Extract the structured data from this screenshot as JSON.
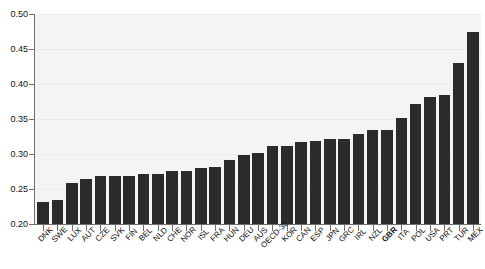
{
  "chart_data": {
    "type": "bar",
    "title": "",
    "subtitle": "",
    "xlabel": "",
    "ylabel": "",
    "ylim": [
      0.2,
      0.5
    ],
    "yticks": [
      0.2,
      0.25,
      0.3,
      0.35,
      0.4,
      0.45,
      0.5
    ],
    "ytick_labels": [
      "0.20",
      "0.25",
      "0.30",
      "0.35",
      "0.40",
      "0.45",
      "0.50"
    ],
    "grid": true,
    "legend": null,
    "bar_color": "#2b2b2b",
    "plot_background": "#f4f4f4",
    "highlight_category": "GBR",
    "categories": [
      "DNK",
      "SWE",
      "LUX",
      "AUT",
      "CZE",
      "SVK",
      "FIN",
      "BEL",
      "NLD",
      "CHE",
      "NOR",
      "ISL",
      "FRA",
      "HUN",
      "DEU",
      "AUS",
      "OECD-30",
      "KOR",
      "CAN",
      "ESP",
      "JPN",
      "GRC",
      "IRL",
      "NZL",
      "GBR",
      "ITA",
      "POL",
      "USA",
      "PRT",
      "TUR",
      "MEX"
    ],
    "values": [
      0.232,
      0.234,
      0.258,
      0.265,
      0.268,
      0.268,
      0.269,
      0.271,
      0.271,
      0.276,
      0.276,
      0.28,
      0.281,
      0.291,
      0.298,
      0.301,
      0.311,
      0.312,
      0.317,
      0.319,
      0.321,
      0.321,
      0.328,
      0.335,
      0.335,
      0.352,
      0.372,
      0.381,
      0.385,
      0.43,
      0.474
    ]
  }
}
